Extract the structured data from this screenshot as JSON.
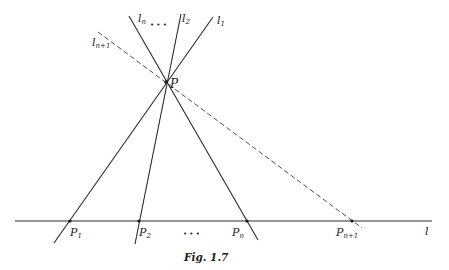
{
  "figure": {
    "caption": "Fig. 1.7",
    "point_P": {
      "label": "P",
      "x": 166,
      "y": 82
    },
    "baseline": {
      "label": "l",
      "x1": 15,
      "y1": 221,
      "x2": 432,
      "y2": 221
    },
    "lines": [
      {
        "name": "l1",
        "base": "l",
        "sub": "1",
        "x1": 54,
        "y1": 243,
        "x2": 213,
        "y2": 17,
        "style": "solid",
        "label_x": 217,
        "label_y": 24
      },
      {
        "name": "l2",
        "base": "l",
        "sub": "2",
        "x1": 135,
        "y1": 244,
        "x2": 181,
        "y2": 14,
        "style": "solid",
        "label_x": 182,
        "label_y": 22
      },
      {
        "name": "ln",
        "base": "l",
        "sub": "n",
        "x1": 129,
        "y1": 16,
        "x2": 258,
        "y2": 240,
        "style": "solid",
        "label_x": 138,
        "label_y": 22
      },
      {
        "name": "ln+1",
        "base": "l",
        "sub": "n+1",
        "x1": 98,
        "y1": 32,
        "x2": 362,
        "y2": 228,
        "style": "dashed",
        "label_x": 92,
        "label_y": 46
      }
    ],
    "top_ellipsis": {
      "text": "• • •",
      "x": 150,
      "y": 27
    },
    "bottom_ellipsis": {
      "text": "• • •",
      "x": 183,
      "y": 236
    },
    "base_points": [
      {
        "name": "P1",
        "base": "P",
        "sub": "1",
        "x": 70,
        "y": 221,
        "label_x": 70,
        "label_y": 236
      },
      {
        "name": "P2",
        "base": "P",
        "sub": "2",
        "x": 139,
        "y": 221,
        "label_x": 139,
        "label_y": 236
      },
      {
        "name": "Pn",
        "base": "P",
        "sub": "n",
        "x": 247,
        "y": 221,
        "label_x": 232,
        "label_y": 236
      },
      {
        "name": "Pn+1",
        "base": "P",
        "sub": "n+1",
        "x": 352,
        "y": 221,
        "label_x": 336,
        "label_y": 236
      }
    ]
  }
}
